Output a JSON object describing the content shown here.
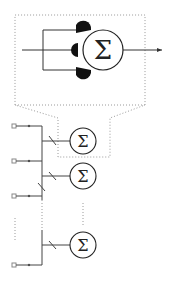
{
  "diagram": {
    "type": "neural-network-schematic",
    "colors": {
      "stroke": "#333333",
      "dotted": "#9a9a9a",
      "synapse": "#111111",
      "background": "#ffffff"
    },
    "zoom_inset": {
      "neuron_symbol": "Σ",
      "synapse_count": 3,
      "input_label": "",
      "output": "arrow"
    },
    "network": {
      "input_count_visible": 4,
      "neuron_symbol": "Σ",
      "neurons_visible": 3,
      "ellipsis": "vertical dotted lines indicate more inputs and neurons"
    },
    "neurons": [
      {
        "id": "n1",
        "symbol": "Σ"
      },
      {
        "id": "n2",
        "symbol": "Σ"
      },
      {
        "id": "n3",
        "symbol": "Σ"
      }
    ],
    "big_neuron": {
      "symbol": "Σ"
    }
  }
}
